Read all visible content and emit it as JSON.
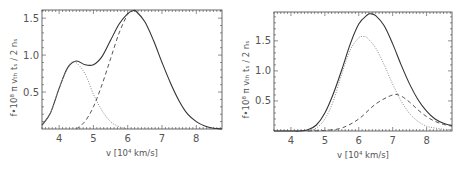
{
  "chart_data": [
    {
      "type": "line",
      "title": "",
      "xlabel": "v [10⁴ km/s]",
      "ylabel": "f•10⁸ π vₜₕ tₛ / 2 nₛ",
      "xlim": [
        3.5,
        8.75
      ],
      "ylim": [
        0,
        1.61
      ],
      "xticks": [
        4,
        5,
        6,
        7,
        8
      ],
      "yticks": [
        0.5,
        1.0,
        1.5
      ],
      "ytick_labels": [
        "0.5",
        "1.0",
        "1.5"
      ],
      "grid": false,
      "legend": null,
      "frame": {
        "left": 42,
        "top": 10,
        "right": 222,
        "bottom": 129
      },
      "series": [
        {
          "name": "total",
          "style": "solid",
          "x": [
            3.5,
            3.75,
            4.0,
            4.25,
            4.5,
            4.75,
            5.0,
            5.25,
            5.5,
            5.75,
            6.0,
            6.15,
            6.25,
            6.5,
            6.75,
            7.0,
            7.25,
            7.5,
            7.75,
            8.0,
            8.25,
            8.5,
            8.75
          ],
          "y": [
            0.05,
            0.22,
            0.55,
            0.83,
            0.92,
            0.87,
            0.87,
            0.98,
            1.2,
            1.42,
            1.56,
            1.6,
            1.59,
            1.45,
            1.2,
            0.9,
            0.62,
            0.38,
            0.2,
            0.1,
            0.04,
            0.01,
            0.0
          ]
        },
        {
          "name": "component 1",
          "style": "dotted",
          "x": [
            3.5,
            3.75,
            4.0,
            4.25,
            4.45,
            4.75,
            5.0,
            5.25,
            5.5,
            5.75,
            6.0
          ],
          "y": [
            0.05,
            0.22,
            0.55,
            0.83,
            0.91,
            0.75,
            0.47,
            0.25,
            0.1,
            0.03,
            0.0
          ]
        },
        {
          "name": "component 2",
          "style": "dashed",
          "x": [
            4.5,
            4.75,
            5.0,
            5.25,
            5.5,
            5.75,
            6.0,
            6.15
          ],
          "y": [
            0.0,
            0.1,
            0.3,
            0.6,
            0.95,
            1.3,
            1.55,
            1.6
          ]
        }
      ]
    },
    {
      "type": "line",
      "title": "",
      "xlabel": "v [10⁴ km/s]",
      "ylabel": "f•10⁸ π vₜₕ tₛ / 2 nₛ",
      "xlim": [
        3.5,
        8.75
      ],
      "ylim": [
        0,
        1.98
      ],
      "xticks": [
        4,
        5,
        6,
        7,
        8
      ],
      "yticks": [
        0.5,
        1.0,
        1.5
      ],
      "ytick_labels": [
        "0.5",
        "1.0",
        "1.5"
      ],
      "grid": false,
      "legend": null,
      "frame": {
        "left": 274,
        "top": 12,
        "right": 452,
        "bottom": 131
      },
      "series": [
        {
          "name": "total",
          "style": "solid",
          "x": [
            3.5,
            4.0,
            4.25,
            4.5,
            4.75,
            5.0,
            5.25,
            5.5,
            5.75,
            6.0,
            6.25,
            6.35,
            6.5,
            6.75,
            7.0,
            7.25,
            7.5,
            7.75,
            8.0,
            8.25,
            8.5,
            8.75
          ],
          "y": [
            0.0,
            0.0,
            0.0,
            0.02,
            0.1,
            0.3,
            0.62,
            1.02,
            1.45,
            1.78,
            1.93,
            1.95,
            1.92,
            1.75,
            1.45,
            1.1,
            0.78,
            0.52,
            0.33,
            0.2,
            0.13,
            0.09
          ]
        },
        {
          "name": "component 1",
          "style": "dotted",
          "x": [
            4.5,
            4.75,
            5.0,
            5.25,
            5.5,
            5.75,
            6.0,
            6.15,
            6.25,
            6.5,
            6.75,
            7.0,
            7.25,
            7.5,
            7.75,
            8.0,
            8.25,
            8.5,
            8.75
          ],
          "y": [
            0.0,
            0.05,
            0.2,
            0.5,
            0.95,
            1.35,
            1.55,
            1.57,
            1.55,
            1.38,
            1.1,
            0.78,
            0.5,
            0.29,
            0.16,
            0.08,
            0.05,
            0.03,
            0.02
          ]
        },
        {
          "name": "component 2",
          "style": "dashed",
          "x": [
            4.5,
            5.0,
            5.5,
            6.0,
            6.5,
            7.0,
            7.25,
            7.5,
            7.75,
            8.0,
            8.25,
            8.5,
            8.75
          ],
          "y": [
            0.0,
            0.01,
            0.05,
            0.2,
            0.45,
            0.6,
            0.58,
            0.48,
            0.35,
            0.24,
            0.16,
            0.11,
            0.08
          ]
        }
      ]
    }
  ],
  "panels": [
    {
      "xlabel": "v [10⁴ km/s]",
      "ylabel": "f•10⁸ π vₜₕ tₛ / 2 nₛ"
    },
    {
      "xlabel": "v [10⁴ km/s]",
      "ylabel": "f•10⁸ π vₜₕ tₛ / 2 nₛ"
    }
  ],
  "colors": {
    "solid": "#333333",
    "dotted": "#8a8a8a",
    "dashed": "#555555",
    "axis": "#444444"
  }
}
